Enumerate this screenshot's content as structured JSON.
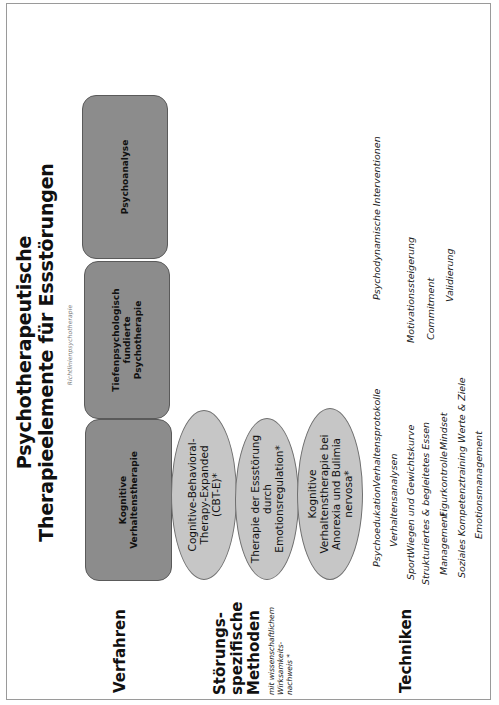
{
  "title": {
    "line1": "Psychotherapeutische",
    "line2": "Therapieelemente für Essstörungen"
  },
  "richtlinien_label": "Richtlinienpsychotherapie",
  "rows": {
    "verfahren": {
      "label": "Verfahren"
    },
    "methoden": {
      "label_line1": "Störungs-",
      "label_line2": "spezifische",
      "label_line3": "Methoden",
      "note_line1": "mit wissenschaftlichem",
      "note_line2": "Wirksamkeits-",
      "note_line3": "nachweis *"
    },
    "techniken": {
      "label": "Techniken"
    }
  },
  "verfahren_boxes": [
    {
      "line1": "Kognitive",
      "line2": "Verhaltenstherapie",
      "line3": ""
    },
    {
      "line1": "Tiefenpsychologisch",
      "line2": "fundierte",
      "line3": "Psychotherapie"
    },
    {
      "line1": "Psychoanalyse",
      "line2": "",
      "line3": ""
    }
  ],
  "methoden_ellipses": [
    {
      "line1": "Cognitive-Behavioral-",
      "line2": "Therapy-Expanded",
      "line3": "(CBT-E)*",
      "line4": ""
    },
    {
      "line1": "Therapie der Essstörung",
      "line2": "durch",
      "line3": "Emotionsregulation*",
      "line4": ""
    },
    {
      "line1": "Kognitive",
      "line2": "Verhaltenstherapie bei",
      "line3": "Anorexia und Bulimia",
      "line4": "nervosa*"
    }
  ],
  "techniken": [
    "Psychoedukation",
    "Verhaltensprotokolle",
    "Verhaltensanalysen",
    "Sport",
    "Wiegen und Gewichtskurve",
    "Strukturiertes & begleitetes Essen",
    "Management",
    "Figurkontrolle",
    "Mindset",
    "Soziales Kompetenztraining",
    "Werte & Ziele",
    "Emotionsmanagement",
    "Motivationssteigerung",
    "Commitment",
    "Validierung",
    "Psychodynamische Interventionen"
  ],
  "colors": {
    "verfahren_box_fill": "#8c8c8c",
    "methoden_ellipse_fill": "#c6c6c6",
    "frame_border": "#9a9a9a"
  }
}
